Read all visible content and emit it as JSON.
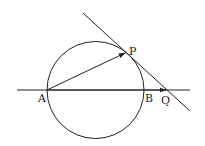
{
  "diagram": {
    "type": "geometry",
    "stroke_color": "#222222",
    "background": "#ffffff",
    "circle": {
      "cx": 95.5,
      "cy": 90,
      "r": 48.5
    },
    "line_horizontal": {
      "x1": 17,
      "y1": 90,
      "x2": 190,
      "y2": 90
    },
    "line_tangent": {
      "x1": 83,
      "y1": 13,
      "x2": 190,
      "y2": 111
    },
    "vector_AP": {
      "from": "A",
      "to": "P"
    },
    "vector_AQ": {
      "from": "A",
      "to": "Q"
    },
    "points": {
      "A": {
        "label": "A",
        "x": 47,
        "y": 90
      },
      "B": {
        "label": "B",
        "x": 144,
        "y": 90
      },
      "P": {
        "label": "P",
        "x": 126,
        "y": 52
      },
      "Q": {
        "label": "Q",
        "x": 167,
        "y": 90
      }
    }
  }
}
